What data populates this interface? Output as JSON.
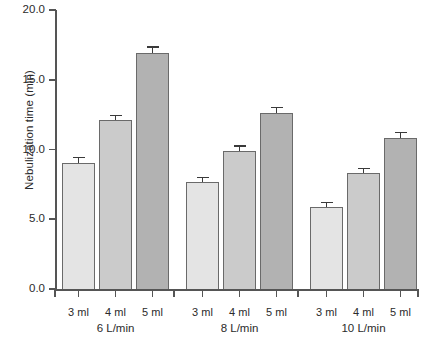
{
  "chart_data": {
    "type": "bar",
    "title": "",
    "xlabel": "",
    "ylabel": "Nebulization time (min)",
    "ylim": [
      0.0,
      20.0
    ],
    "ytick_labels": [
      "0.0",
      "5.0",
      "10.0",
      "15.0",
      "20.0"
    ],
    "ytick_values": [
      0.0,
      5.0,
      10.0,
      15.0,
      20.0
    ],
    "grid": false,
    "legend": "none",
    "categories": [
      "6 L/min",
      "8 L/min",
      "10 L/min"
    ],
    "series": [
      {
        "name": "3 ml",
        "color": "#e4e4e4",
        "values": [
          9.0,
          7.7,
          5.9
        ],
        "errors": [
          0.45,
          0.35,
          0.35
        ]
      },
      {
        "name": "4 ml",
        "color": "#cbcbcb",
        "values": [
          12.1,
          9.9,
          8.3
        ],
        "errors": [
          0.4,
          0.4,
          0.4
        ]
      },
      {
        "name": "5 ml",
        "color": "#b2b2b2",
        "values": [
          16.9,
          12.6,
          10.8
        ],
        "errors": [
          0.5,
          0.45,
          0.45
        ]
      }
    ],
    "groups": [
      {
        "label": "6 L/min",
        "bars": [
          {
            "label": "3 ml",
            "value": 9.0,
            "error": 0.45,
            "shade": "s3"
          },
          {
            "label": "4 ml",
            "value": 12.1,
            "error": 0.4,
            "shade": "s4"
          },
          {
            "label": "5 ml",
            "value": 16.9,
            "error": 0.5,
            "shade": "s5"
          }
        ]
      },
      {
        "label": "8 L/min",
        "bars": [
          {
            "label": "3 ml",
            "value": 7.7,
            "error": 0.35,
            "shade": "s3"
          },
          {
            "label": "4 ml",
            "value": 9.9,
            "error": 0.4,
            "shade": "s4"
          },
          {
            "label": "5 ml",
            "value": 12.6,
            "error": 0.45,
            "shade": "s5"
          }
        ]
      },
      {
        "label": "10 L/min",
        "bars": [
          {
            "label": "3 ml",
            "value": 5.9,
            "error": 0.35,
            "shade": "s3"
          },
          {
            "label": "4 ml",
            "value": 8.3,
            "error": 0.4,
            "shade": "s4"
          },
          {
            "label": "5 ml",
            "value": 10.8,
            "error": 0.45,
            "shade": "s5"
          }
        ]
      }
    ]
  },
  "axis": {
    "y_title": "Nebulization time (min)"
  }
}
